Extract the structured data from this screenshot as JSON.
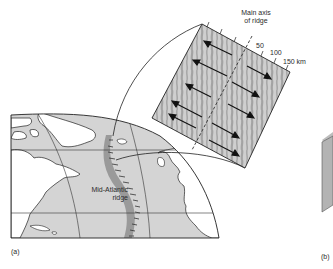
{
  "figure": {
    "panel_a_label": "(a)",
    "panel_b_label": "(b)",
    "map": {
      "ridge_label_line1": "Mid-Atlantic",
      "ridge_label_line2": "ridge"
    },
    "inset": {
      "axis_label_line1": "Main axis",
      "axis_label_line2": "of ridge",
      "scale_ticks": [
        "50",
        "100",
        "150 km"
      ],
      "arrow_rows": 5,
      "arrows_left": "spreading direction away from axis (west)",
      "arrows_right": "spreading direction away from axis (east)"
    }
  },
  "colors": {
    "ocean": "#d4d4d4",
    "land": "#ffffff",
    "ridge_band": "#9a9a9a",
    "inset_light": "#cfcfcf",
    "inset_dark": "#a3a3a3",
    "line": "#222222",
    "text": "#2b2b2b"
  }
}
